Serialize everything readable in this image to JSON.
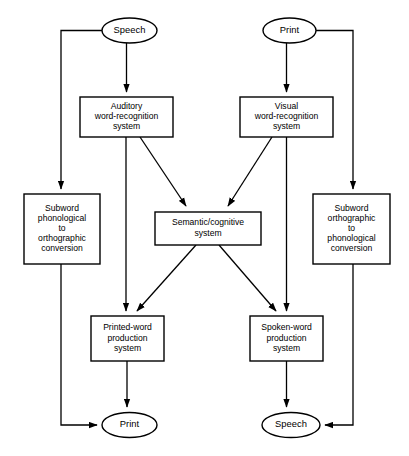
{
  "diagram": {
    "background_color": "#ffffff",
    "line_color": "#000000",
    "node_fill": "#ffffff",
    "nodes": [
      {
        "id": "speech-in",
        "shape": "ellipse",
        "label": "Speech",
        "lines": [
          "Speech"
        ],
        "cx": 129.5,
        "cy": 30.5,
        "rx": 27.5,
        "ry": 12.5
      },
      {
        "id": "print-in",
        "shape": "ellipse",
        "label": "Print",
        "lines": [
          "Print"
        ],
        "cx": 289.5,
        "cy": 30.5,
        "rx": 26.5,
        "ry": 12.5
      },
      {
        "id": "auditory-word-recognition-system",
        "shape": "box",
        "label": "Auditory word-recognition system",
        "lines": [
          "Auditory",
          "word-recognition",
          "system"
        ],
        "x": 80,
        "y": 97,
        "w": 93,
        "h": 40
      },
      {
        "id": "visual-word-recognition-system",
        "shape": "box",
        "label": "Visual word-recognition system",
        "lines": [
          "Visual",
          "word-recognition",
          "system"
        ],
        "x": 240,
        "y": 97,
        "w": 93,
        "h": 40
      },
      {
        "id": "subword-phonological-to-orthographic-conversion",
        "shape": "box",
        "label": "Subword phonological to orthographic conversion",
        "lines": [
          "Subword",
          "phonological",
          "to",
          "orthographic",
          "conversion"
        ],
        "x": 24,
        "y": 194,
        "w": 76,
        "h": 70
      },
      {
        "id": "subword-orthographic-to-phonological-conversion",
        "shape": "box",
        "label": "Subword orthographic to phonological conversion",
        "lines": [
          "Subword",
          "orthographic",
          "to",
          "phonological",
          "conversion"
        ],
        "x": 313,
        "y": 194,
        "w": 77,
        "h": 70
      },
      {
        "id": "semantic-cognitive-system",
        "shape": "box",
        "label": "Semantic/cognitive system",
        "lines": [
          "Semantic/cognitive",
          "system"
        ],
        "x": 155,
        "y": 212,
        "w": 106,
        "h": 33
      },
      {
        "id": "printed-word-production-system",
        "shape": "box",
        "label": "Printed-word production system",
        "lines": [
          "Printed-word",
          "production",
          "system"
        ],
        "x": 91,
        "y": 316,
        "w": 73,
        "h": 45
      },
      {
        "id": "spoken-word-production-system",
        "shape": "box",
        "label": "Spoken-word production system",
        "lines": [
          "Spoken-word",
          "production",
          "system"
        ],
        "x": 250,
        "y": 316,
        "w": 73,
        "h": 45
      },
      {
        "id": "print-out",
        "shape": "ellipse",
        "label": "Print",
        "lines": [
          "Print"
        ],
        "cx": 129.5,
        "cy": 425,
        "rx": 27.5,
        "ry": 12.5
      },
      {
        "id": "speech-out",
        "shape": "ellipse",
        "label": "Speech",
        "lines": [
          "Speech"
        ],
        "cx": 291,
        "cy": 425,
        "rx": 29,
        "ry": 12.5
      }
    ],
    "edges": [
      {
        "id": "speech-to-auditory",
        "from": "speech-in",
        "to": "auditory-word-recognition-system",
        "path": "M 126.5,43 L 126.5,92",
        "arrow": true
      },
      {
        "id": "speech-to-subword-phonological",
        "from": "speech-in",
        "to": "subword-phonological-to-orthographic-conversion",
        "path": "M 102,30.5 L 61,30.5 L 61,189",
        "arrow": true
      },
      {
        "id": "print-to-visual",
        "from": "print-in",
        "to": "visual-word-recognition-system",
        "path": "M 286.5,43 L 286.5,92",
        "arrow": true
      },
      {
        "id": "print-to-subword-orthographic",
        "from": "print-in",
        "to": "subword-orthographic-to-phonological-conversion",
        "path": "M 316,30.5 L 353,30.5 L 353,189",
        "arrow": true
      },
      {
        "id": "auditory-to-semantic",
        "from": "auditory-word-recognition-system",
        "to": "semantic-cognitive-system",
        "path": "M 140,137 L 186,206",
        "arrow": true
      },
      {
        "id": "auditory-to-printed-word",
        "from": "auditory-word-recognition-system",
        "to": "printed-word-production-system",
        "path": "M 126,137 L 126,311",
        "arrow": true
      },
      {
        "id": "visual-to-semantic",
        "from": "visual-word-recognition-system",
        "to": "semantic-cognitive-system",
        "path": "M 272,137 L 228,206",
        "arrow": true
      },
      {
        "id": "visual-to-spoken-word",
        "from": "visual-word-recognition-system",
        "to": "spoken-word-production-system",
        "path": "M 286.5,137 L 286.5,311",
        "arrow": true
      },
      {
        "id": "semantic-to-printed-word",
        "from": "semantic-cognitive-system",
        "to": "printed-word-production-system",
        "path": "M 196,245 L 137,311",
        "arrow": true
      },
      {
        "id": "semantic-to-spoken-word",
        "from": "semantic-cognitive-system",
        "to": "spoken-word-production-system",
        "path": "M 219,245 L 276,311",
        "arrow": true
      },
      {
        "id": "subword-phonological-to-print",
        "from": "subword-phonological-to-orthographic-conversion",
        "to": "print-out",
        "path": "M 61,264 L 61,425 L 97,425",
        "arrow": true
      },
      {
        "id": "printed-word-to-print",
        "from": "printed-word-production-system",
        "to": "print-out",
        "path": "M 127,361 L 127,407",
        "arrow": true
      },
      {
        "id": "spoken-word-to-speech",
        "from": "spoken-word-production-system",
        "to": "speech-out",
        "path": "M 286.5,361 L 286.5,407",
        "arrow": true
      },
      {
        "id": "subword-orthographic-to-speech",
        "from": "subword-orthographic-to-phonological-conversion",
        "to": "speech-out",
        "path": "M 353,264 L 353,425 L 325,425",
        "arrow": true
      }
    ]
  }
}
